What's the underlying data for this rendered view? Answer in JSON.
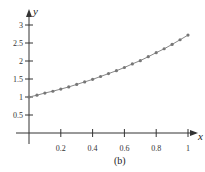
{
  "chart_data": {
    "type": "line",
    "title": "",
    "caption": "(b)",
    "xlabel": "x",
    "ylabel": "y",
    "xlim": [
      0,
      1
    ],
    "ylim": [
      0,
      3
    ],
    "grid": false,
    "legend": null,
    "x_ticks": [
      "0.2",
      "0.4",
      "0.6",
      "0.8",
      "1"
    ],
    "y_ticks": [
      "0.5",
      "1",
      "1.5",
      "2",
      "2.5",
      "3"
    ],
    "series": [
      {
        "name": "y = e^x",
        "marker": "dot",
        "x": [
          0,
          0.05,
          0.1,
          0.15,
          0.2,
          0.25,
          0.3,
          0.35,
          0.4,
          0.45,
          0.5,
          0.55,
          0.6,
          0.65,
          0.7,
          0.75,
          0.8,
          0.85,
          0.9,
          0.95,
          1.0
        ],
        "values": [
          1.0,
          1.05,
          1.11,
          1.16,
          1.22,
          1.28,
          1.35,
          1.42,
          1.49,
          1.57,
          1.65,
          1.73,
          1.82,
          1.92,
          2.01,
          2.12,
          2.23,
          2.34,
          2.46,
          2.59,
          2.72
        ]
      }
    ]
  },
  "colors": {
    "axis": "#333333",
    "line": "#888888",
    "marker": "#777777"
  }
}
